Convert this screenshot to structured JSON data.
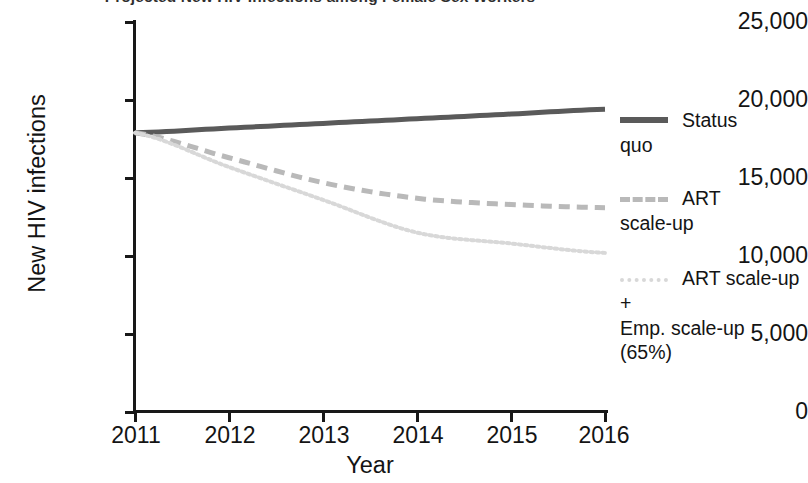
{
  "chart_data": {
    "type": "line",
    "title": "Projected New HIV Infections among Female Sex Workers",
    "xlabel": "Year",
    "ylabel": "New HIV infections",
    "x": [
      2011,
      2012,
      2013,
      2014,
      2015,
      2016
    ],
    "xtick_labels": [
      "2011",
      "2012",
      "2013",
      "2014",
      "2015",
      "2016"
    ],
    "ytick_labels": [
      "0",
      "5,000",
      "10,000",
      "15,000",
      "20,000",
      "25,000"
    ],
    "ytick_values": [
      0,
      5000,
      10000,
      15000,
      20000,
      25000
    ],
    "xlim": [
      2011,
      2016
    ],
    "ylim": [
      0,
      25000
    ],
    "grid": false,
    "legend_position": "right",
    "series": [
      {
        "name": "Status quo",
        "legend_label": "Status\nquo",
        "style": "solid",
        "color": "#5a5a5a",
        "values": [
          17900,
          18200,
          18500,
          18800,
          19100,
          19400
        ]
      },
      {
        "name": "ART scale-up",
        "legend_label": "ART\nscale-up",
        "style": "dashed",
        "color": "#b9b9b9",
        "values": [
          17900,
          16300,
          14700,
          13700,
          13300,
          13100
        ]
      },
      {
        "name": "ART scale-up + Emp. scale-up (65%)",
        "legend_label": "ART scale-up +\nEmp. scale-up\n(65%)",
        "style": "dotted",
        "color": "#d8d8d8",
        "values": [
          17900,
          15700,
          13600,
          11500,
          10800,
          10200
        ]
      }
    ]
  },
  "axis": {
    "y_labels": [
      "25,000",
      "20,000",
      "15,000",
      "10,000",
      "5,000",
      "0"
    ],
    "x_labels": [
      "2011",
      "2012",
      "2013",
      "2014",
      "2015",
      "2016"
    ],
    "y_title": "New HIV infections",
    "x_title": "Year"
  },
  "legend": {
    "items": [
      {
        "label": "Status\nquo",
        "swatch": "solid-line-swatch"
      },
      {
        "label": "ART\nscale-up",
        "swatch": "dashed-line-swatch"
      },
      {
        "label": "ART scale-up +\nEmp. scale-up\n(65%)",
        "swatch": "dotted-line-swatch"
      }
    ]
  },
  "title": "Projected New HIV Infections among Female Sex Workers"
}
